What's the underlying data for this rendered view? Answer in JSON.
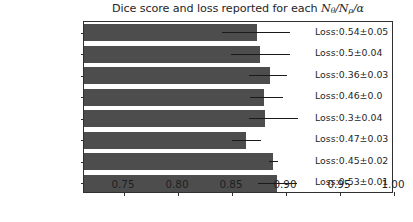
{
  "chart_data": {
    "type": "bar",
    "orientation": "horizontal",
    "title": "Dice score and loss reported for each Nθ/Nρ/α",
    "title_parts": {
      "prefix": "Dice score and loss reported for each ",
      "var1": "N",
      "var1_sub": "θ",
      "sep1": "/",
      "var2": "N",
      "var2_sub": "ρ",
      "sep2": "/",
      "var3": "α"
    },
    "xlabel": "",
    "ylabel": "",
    "xlim": [
      0.713,
      1.0
    ],
    "ylim_categories": 8,
    "grid": false,
    "legend": false,
    "bar_color": "#4d4d4d",
    "error_color": "#1a1a1a",
    "xticks": [
      0.75,
      0.8,
      0.85,
      0.9,
      0.95,
      1.0
    ],
    "xtick_labels": [
      "0.75",
      "0.80",
      "0.85",
      "0.90",
      "0.95",
      "1.00"
    ],
    "categories": [
      "13/14/1.0",
      "13/14/0.6",
      "13/None/1.0",
      "13/None/0.6",
      "None/14/1.0",
      "None/14/0.6",
      "None/None/1.0",
      "None/None/0.6"
    ],
    "values": [
      0.873,
      0.876,
      0.885,
      0.88,
      0.881,
      0.863,
      0.888,
      0.892
    ],
    "errors_low": [
      0.841,
      0.849,
      0.866,
      0.867,
      0.866,
      0.85,
      0.884,
      0.874
    ],
    "errors_high": [
      0.904,
      0.904,
      0.901,
      0.897,
      0.911,
      0.877,
      0.893,
      0.91
    ],
    "annotations": [
      "Loss:0.54±0.05",
      "Loss:0.5±0.04",
      "Loss:0.36±0.03",
      "Loss:0.46±0.0",
      "Loss:0.3±0.04",
      "Loss:0.47±0.03",
      "Loss:0.45±0.02",
      "Loss:0.53±0.01"
    ],
    "loss_values": [
      0.54,
      0.5,
      0.36,
      0.46,
      0.3,
      0.47,
      0.45,
      0.53
    ],
    "loss_errors": [
      0.05,
      0.04,
      0.03,
      0.0,
      0.04,
      0.03,
      0.02,
      0.01
    ]
  }
}
